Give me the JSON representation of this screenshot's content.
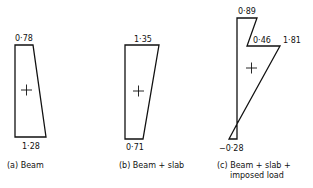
{
  "diagrams": [
    {
      "id": "a",
      "caption": "(a) Beam",
      "top_value": "0·78",
      "bottom_value": "1·28",
      "sign": "+"
    },
    {
      "id": "b",
      "caption": "(b) Beam + slab",
      "top_value": "1·35",
      "bottom_value": "0·71",
      "sign": "+"
    },
    {
      "id": "c",
      "caption_line1": "(c) Beam + slab +",
      "caption_line2": "imposed load",
      "top_value": "0·89",
      "mid_left_value": "0·46",
      "mid_right_value": "1·81",
      "bottom_value": "−0·28",
      "sign": "+"
    }
  ]
}
